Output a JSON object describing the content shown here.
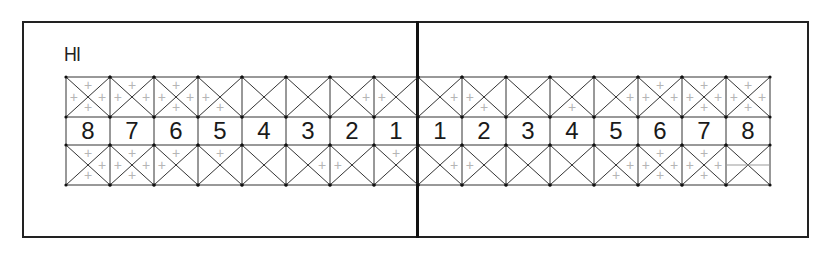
{
  "chart_label": "HI",
  "colors": {
    "line": "#333333",
    "frame": "#222222",
    "marker": "#b5b5b5",
    "text": "#1a1a1a"
  },
  "left_quadrant": {
    "teeth": [
      "8",
      "7",
      "6",
      "5",
      "4",
      "3",
      "2",
      "1"
    ],
    "upper_marks": [
      [
        "t",
        "l",
        "r",
        "b"
      ],
      [
        "t",
        "l",
        "r"
      ],
      [
        "t",
        "l",
        "r",
        "b"
      ],
      [
        "l",
        "b"
      ],
      [],
      [],
      [
        "r"
      ],
      [
        "l"
      ]
    ],
    "lower_marks": [
      [
        "t",
        "r",
        "b"
      ],
      [
        "t",
        "l",
        "r",
        "b"
      ],
      [
        "t",
        "l"
      ],
      [
        "t"
      ],
      [],
      [
        "r"
      ],
      [
        "l"
      ],
      [
        "t"
      ]
    ]
  },
  "right_quadrant": {
    "teeth": [
      "1",
      "2",
      "3",
      "4",
      "5",
      "6",
      "7",
      "8"
    ],
    "upper_marks": [
      [
        "r"
      ],
      [
        "l",
        "b"
      ],
      [],
      [
        "b"
      ],
      [
        "r"
      ],
      [
        "t",
        "l",
        "r"
      ],
      [
        "t",
        "l",
        "r",
        "b"
      ],
      [
        "t",
        "l",
        "r",
        "b"
      ]
    ],
    "lower_marks": [
      [
        "r"
      ],
      [
        "l"
      ],
      [],
      [],
      [
        "r",
        "b"
      ],
      [
        "t",
        "l",
        "r",
        "b"
      ],
      [
        "t",
        "l",
        "r",
        "b"
      ],
      [
        "hline"
      ]
    ]
  },
  "marker_symbol": "+"
}
